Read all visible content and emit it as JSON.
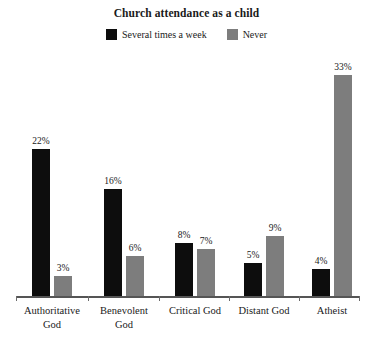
{
  "chart_data": {
    "type": "bar",
    "title": "Church attendance as a child",
    "xlabel": "",
    "ylabel": "",
    "ylim": [
      0,
      35
    ],
    "grid": false,
    "legend_position": "top-center",
    "categories": [
      "Authoritative God",
      "Benevolent God",
      "Critical God",
      "Distant God",
      "Atheist"
    ],
    "category_lines": [
      [
        "Authoritative",
        "God"
      ],
      [
        "Benevolent",
        "God"
      ],
      [
        "Critical God"
      ],
      [
        "Distant God"
      ],
      [
        "Atheist"
      ]
    ],
    "series": [
      {
        "name": "Several times a week",
        "color": "#0d0d0d",
        "values": [
          22,
          16,
          8,
          5,
          4
        ],
        "labels": [
          "22%",
          "16%",
          "8%",
          "5%",
          "4%"
        ]
      },
      {
        "name": "Never",
        "color": "#7d7d7d",
        "values": [
          3,
          6,
          7,
          9,
          33
        ],
        "labels": [
          "3%",
          "6%",
          "7%",
          "9%",
          "33%"
        ]
      }
    ],
    "value_suffix": "%"
  },
  "legend": {
    "entries": [
      {
        "label": "Several times a week",
        "color": "#0d0d0d",
        "swatch_name": "legend-swatch-several-times-a-week"
      },
      {
        "label": "Never",
        "color": "#7d7d7d",
        "swatch_name": "legend-swatch-never"
      }
    ]
  },
  "axis": {
    "baseline_color": "#555555",
    "tick_color": "#6b6b6b"
  }
}
